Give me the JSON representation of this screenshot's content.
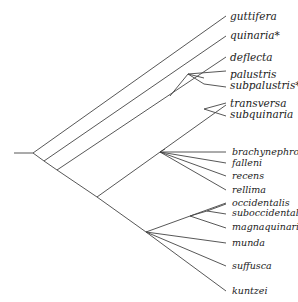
{
  "diagram": {
    "type": "phylogenetic-tree",
    "line_color": "#444444",
    "taxa": [
      {
        "name": "guttifera",
        "x": 230,
        "y": 11,
        "size": "big"
      },
      {
        "name": "quinaria*",
        "x": 230,
        "y": 30,
        "size": "big"
      },
      {
        "name": "deflecta",
        "x": 230,
        "y": 52,
        "size": "big"
      },
      {
        "name": "palustris",
        "x": 230,
        "y": 69,
        "size": "big"
      },
      {
        "name": "subpalustris*",
        "x": 230,
        "y": 80,
        "size": "big"
      },
      {
        "name": "transversa",
        "x": 230,
        "y": 98,
        "size": "big"
      },
      {
        "name": "subquinaria",
        "x": 230,
        "y": 109,
        "size": "big"
      },
      {
        "name": "brachynephros",
        "x": 232,
        "y": 147,
        "size": "small"
      },
      {
        "name": "falleni",
        "x": 232,
        "y": 158,
        "size": "small"
      },
      {
        "name": "recens",
        "x": 232,
        "y": 171,
        "size": "small"
      },
      {
        "name": "rellima",
        "x": 232,
        "y": 185,
        "size": "small"
      },
      {
        "name": "occidentalis",
        "x": 232,
        "y": 198,
        "size": "small"
      },
      {
        "name": "suboccidentalis",
        "x": 232,
        "y": 208,
        "size": "small"
      },
      {
        "name": "magnaquinaria*",
        "x": 232,
        "y": 222,
        "size": "small"
      },
      {
        "name": "munda",
        "x": 232,
        "y": 238,
        "size": "small"
      },
      {
        "name": "suffusca",
        "x": 232,
        "y": 261,
        "size": "small"
      },
      {
        "name": "kuntzei",
        "x": 232,
        "y": 286,
        "size": "small"
      }
    ],
    "branches": [
      [
        14,
        153,
        33,
        153
      ],
      [
        33,
        153,
        226,
        16
      ],
      [
        33,
        153,
        44,
        161
      ],
      [
        44,
        161,
        226,
        36
      ],
      [
        44,
        161,
        57,
        170
      ],
      [
        57,
        170,
        226,
        57
      ],
      [
        188,
        74,
        204,
        78
      ],
      [
        57,
        170,
        97,
        197
      ],
      [
        97,
        197,
        226,
        105
      ],
      [
        204,
        109,
        226,
        116
      ],
      [
        97,
        197,
        146,
        232
      ],
      [
        160,
        152,
        226,
        152
      ],
      [
        160,
        152,
        226,
        163
      ],
      [
        160,
        152,
        226,
        176
      ],
      [
        160,
        152,
        226,
        190
      ],
      [
        146,
        232,
        226,
        203
      ],
      [
        207,
        211,
        226,
        204
      ],
      [
        207,
        211,
        226,
        214
      ],
      [
        190,
        216,
        226,
        228
      ],
      [
        146,
        232,
        226,
        243
      ],
      [
        146,
        232,
        226,
        266
      ],
      [
        146,
        232,
        226,
        291
      ]
    ]
  }
}
